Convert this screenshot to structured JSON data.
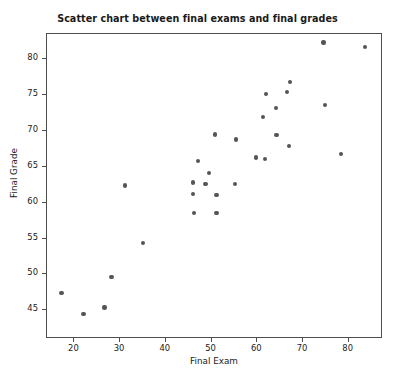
{
  "chart_data": {
    "type": "scatter",
    "title": "Scatter chart between final exams and final grades",
    "xlabel": "Final Exam",
    "ylabel": "Final Grade",
    "xlim": [
      14.0,
      87.5
    ],
    "ylim": [
      41.0,
      83.5
    ],
    "xticks": [
      20,
      30,
      40,
      50,
      60,
      70,
      80
    ],
    "xticklabels": [
      "20",
      "30",
      "40",
      "50",
      "60",
      "70",
      "80"
    ],
    "yticks": [
      45,
      50,
      55,
      60,
      65,
      70,
      75,
      80
    ],
    "yticklabels": [
      "45",
      "50",
      "55",
      "60",
      "65",
      "70",
      "75",
      "80"
    ],
    "grid": false,
    "legend": null,
    "marker": "circle",
    "marker_color": "#555555",
    "marker_size": 4.4,
    "series": [
      {
        "name": "students",
        "points": [
          [
            17.2,
            47.4
          ],
          [
            22.0,
            44.5
          ],
          [
            26.6,
            45.4
          ],
          [
            28.1,
            49.6
          ],
          [
            31.0,
            62.4
          ],
          [
            35.0,
            54.4
          ],
          [
            45.9,
            62.8
          ],
          [
            45.9,
            61.2
          ],
          [
            46.1,
            58.6
          ],
          [
            47.0,
            65.8
          ],
          [
            48.7,
            62.6
          ],
          [
            49.4,
            64.1
          ],
          [
            50.8,
            69.5
          ],
          [
            51.1,
            61.1
          ],
          [
            51.1,
            58.6
          ],
          [
            55.1,
            62.6
          ],
          [
            55.4,
            68.8
          ],
          [
            59.7,
            66.3
          ],
          [
            61.2,
            71.9
          ],
          [
            61.7,
            66.1
          ],
          [
            61.9,
            75.1
          ],
          [
            64.1,
            73.2
          ],
          [
            64.2,
            69.4
          ],
          [
            66.5,
            75.4
          ],
          [
            67.0,
            67.9
          ],
          [
            67.2,
            76.8
          ],
          [
            74.5,
            82.3
          ],
          [
            74.8,
            73.6
          ],
          [
            78.3,
            66.8
          ],
          [
            83.6,
            81.7
          ]
        ]
      }
    ]
  }
}
